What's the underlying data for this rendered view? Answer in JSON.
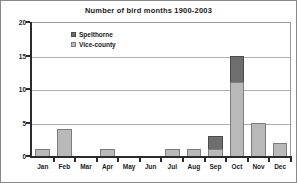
{
  "chart_data": {
    "type": "bar",
    "title": "Number of bird months 1900-2003",
    "xlabel": "",
    "ylabel": "",
    "ylim": [
      0,
      20
    ],
    "yticks": [
      0,
      5,
      10,
      15,
      20
    ],
    "ytick_labels": [
      "0",
      "5",
      "10",
      "15",
      "20"
    ],
    "grid": true,
    "stacked": true,
    "legend_position": "inside-top-left",
    "categories": [
      "Jan",
      "Feb",
      "Mar",
      "Apr",
      "May",
      "Jun",
      "Jul",
      "Aug",
      "Sep",
      "Oct",
      "Nov",
      "Dec"
    ],
    "series": [
      {
        "name": "Vice-county",
        "color": "#b9b9b9",
        "values": [
          1,
          4,
          0,
          1,
          0,
          0,
          1,
          1,
          1,
          11,
          5,
          2
        ]
      },
      {
        "name": "Spelthorne",
        "color": "#6e6e6e",
        "values": [
          0,
          0,
          0,
          0,
          0,
          0,
          0,
          0,
          2,
          4,
          0,
          0
        ]
      }
    ],
    "totals": [
      1,
      4,
      0,
      1,
      0,
      0,
      1,
      1,
      3,
      15,
      5,
      2
    ]
  },
  "legend": {
    "items": [
      {
        "label": "Spelthorne",
        "swatch": "dark"
      },
      {
        "label": "Vice-county",
        "swatch": "light"
      }
    ]
  }
}
